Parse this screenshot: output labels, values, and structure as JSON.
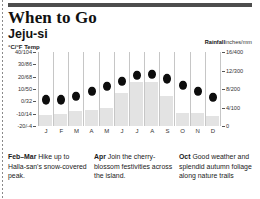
{
  "header": {
    "title": "When to Go",
    "location": "Jeju-si",
    "left_axis_title": "°C/°F Temp",
    "right_axis_title_bold": "Rainfall",
    "right_axis_title_rest": "inches/mm"
  },
  "chart_data": {
    "type": "bar",
    "subtitle": "Jeju-si",
    "xlabel": "",
    "ylabel": "°C/°F Temp",
    "y2label": "Rainfall inches/mm",
    "grid": false,
    "legend": "none",
    "categories": [
      "J",
      "F",
      "M",
      "A",
      "M",
      "J",
      "J",
      "A",
      "S",
      "O",
      "N",
      "D"
    ],
    "month_names": [
      "January",
      "February",
      "March",
      "April",
      "May",
      "June",
      "July",
      "August",
      "September",
      "October",
      "November",
      "December"
    ],
    "ylim": [
      -20,
      40
    ],
    "y2lim": [
      0,
      16
    ],
    "yticks": [
      {
        "label": "40/104",
        "c": 40
      },
      {
        "label": "30/86",
        "c": 30
      },
      {
        "label": "20/68",
        "c": 20
      },
      {
        "label": "10/50",
        "c": 10
      },
      {
        "label": "0/32",
        "c": 0
      },
      {
        "label": "-10/14",
        "c": -10
      },
      {
        "label": "-20/-4",
        "c": -20
      }
    ],
    "y2ticks": [
      {
        "label": "16/400",
        "v": 16
      },
      {
        "label": "12/300",
        "v": 12
      },
      {
        "label": "8/200",
        "v": 8
      },
      {
        "label": "4/100",
        "v": 4
      },
      {
        "label": "0",
        "v": 0
      }
    ],
    "series": [
      {
        "name": "Temperature",
        "unit": "°C",
        "marker": "dot",
        "values": [
          5,
          5,
          8,
          12,
          16,
          20,
          25,
          26,
          22,
          17,
          12,
          7
        ]
      },
      {
        "name": "Rainfall",
        "unit": "inches",
        "marker": "bar",
        "values": [
          2.4,
          2.6,
          3.2,
          3.5,
          4.0,
          7.2,
          9.6,
          9.6,
          6.4,
          2.8,
          2.8,
          2.2
        ]
      }
    ]
  },
  "notes": [
    {
      "month": "Feb–Mar",
      "text": "Hike up to Halla-san's snow-covered peak."
    },
    {
      "month": "Apr",
      "text": "Join the cherry-blossom festivities across the island."
    },
    {
      "month": "Oct",
      "text": "Good weather and splendid autumn foliage along nature trails"
    }
  ]
}
